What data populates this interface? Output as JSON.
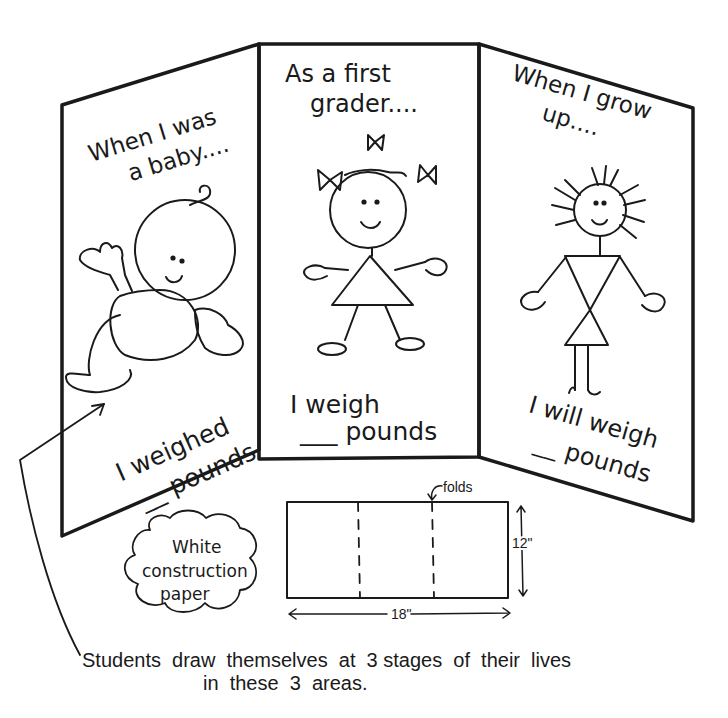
{
  "panels": {
    "left": {
      "heading_line1": "When I was",
      "heading_line2": "a baby....",
      "figure": "baby",
      "caption_line1": "I weighed",
      "caption_line2": "__ pounds"
    },
    "center": {
      "heading_line1": "As a first",
      "heading_line2": "grader....",
      "figure": "girl-with-bows",
      "caption_line1": "I   weigh",
      "caption_line2": "___ pounds"
    },
    "right": {
      "heading_line1": "When I grow",
      "heading_line2": "up....",
      "figure": "grown-woman",
      "caption_line1": "I will weigh",
      "caption_line2": "__ pounds"
    }
  },
  "material_cloud": {
    "line1": "White",
    "line2": "construction",
    "line3": "paper"
  },
  "paper_diagram": {
    "folds_label": "folds",
    "height_label": "12\"",
    "width_label": "18\""
  },
  "footer": {
    "line1": "Students  draw  themselves  at  3 stages  of  their  lives",
    "line2": "in  these  3  areas."
  },
  "colors": {
    "ink": "#1a1a1a",
    "paper": "#ffffff"
  }
}
